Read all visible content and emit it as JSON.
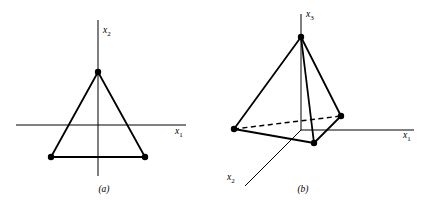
{
  "figure": {
    "background_color": "#ffffff",
    "ink_color": "#000000",
    "panels": [
      {
        "id": "a",
        "caption": "(a)",
        "description": "2-simplex (triangle) in the x1-x2 plane",
        "axes": [
          {
            "name": "x1-axis",
            "label_base": "x",
            "label_sub": "1",
            "orientation": "horizontal"
          },
          {
            "name": "x2-axis",
            "label_base": "x",
            "label_sub": "2",
            "orientation": "vertical"
          }
        ],
        "vertices": [
          {
            "name": "apex",
            "x": 98,
            "y": 72
          },
          {
            "name": "bottom-left",
            "x": 51,
            "y": 157
          },
          {
            "name": "bottom-right",
            "x": 145,
            "y": 157
          }
        ],
        "edges": [
          {
            "from": "apex",
            "to": "bottom-left",
            "style": "solid"
          },
          {
            "from": "apex",
            "to": "bottom-right",
            "style": "solid"
          },
          {
            "from": "bottom-left",
            "to": "bottom-right",
            "style": "solid"
          }
        ]
      },
      {
        "id": "b",
        "caption": "(b)",
        "description": "3-simplex (tetrahedron) in x1-x2-x3 space",
        "axes": [
          {
            "name": "x1-axis",
            "label_base": "x",
            "label_sub": "1",
            "orientation": "horizontal"
          },
          {
            "name": "x2-axis",
            "label_base": "x",
            "label_sub": "2",
            "orientation": "diagonal"
          },
          {
            "name": "x3-axis",
            "label_base": "x",
            "label_sub": "3",
            "orientation": "vertical"
          }
        ],
        "vertices": [
          {
            "name": "apex",
            "x": 83,
            "y": 37
          },
          {
            "name": "left",
            "x": 16,
            "y": 129
          },
          {
            "name": "right",
            "x": 123,
            "y": 116
          },
          {
            "name": "front",
            "x": 96,
            "y": 143
          }
        ],
        "edges": [
          {
            "from": "apex",
            "to": "left",
            "style": "solid"
          },
          {
            "from": "apex",
            "to": "right",
            "style": "solid"
          },
          {
            "from": "apex",
            "to": "front",
            "style": "solid"
          },
          {
            "from": "left",
            "to": "front",
            "style": "solid"
          },
          {
            "from": "right",
            "to": "front",
            "style": "solid"
          },
          {
            "from": "left",
            "to": "right",
            "style": "dashed"
          }
        ]
      }
    ]
  }
}
